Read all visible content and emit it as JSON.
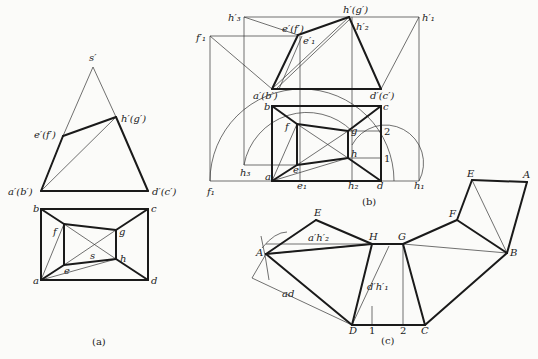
{
  "colors": {
    "line": "#1a1a1a",
    "thin": "#333333",
    "background": "#fbfbf9"
  },
  "figures": [
    {
      "id": "a",
      "caption": "(a)",
      "caption_pos": [
        92,
        345
      ],
      "thick_lines": [
        [
          [
            41,
            191
          ],
          [
            63,
            136
          ]
        ],
        [
          [
            63,
            136
          ],
          [
            116,
            117
          ]
        ],
        [
          [
            116,
            117
          ],
          [
            148,
            191
          ]
        ],
        [
          [
            41,
            191
          ],
          [
            148,
            191
          ]
        ],
        [
          [
            41,
            209
          ],
          [
            148,
            209
          ]
        ],
        [
          [
            148,
            209
          ],
          [
            148,
            280
          ]
        ],
        [
          [
            148,
            280
          ],
          [
            41,
            280
          ]
        ],
        [
          [
            41,
            280
          ],
          [
            41,
            209
          ]
        ],
        [
          [
            41,
            209
          ],
          [
            64,
            224
          ]
        ],
        [
          [
            64,
            224
          ],
          [
            116,
            230
          ]
        ],
        [
          [
            116,
            230
          ],
          [
            148,
            209
          ]
        ],
        [
          [
            64,
            224
          ],
          [
            64,
            265
          ]
        ],
        [
          [
            64,
            265
          ],
          [
            116,
            259
          ]
        ],
        [
          [
            116,
            259
          ],
          [
            116,
            230
          ]
        ],
        [
          [
            41,
            280
          ],
          [
            64,
            265
          ]
        ],
        [
          [
            116,
            259
          ],
          [
            148,
            280
          ]
        ]
      ],
      "thin_lines": [
        [
          [
            63,
            136
          ],
          [
            93,
            67
          ]
        ],
        [
          [
            93,
            67
          ],
          [
            116,
            117
          ]
        ],
        [
          [
            41,
            191
          ],
          [
            116,
            117
          ]
        ],
        [
          [
            64,
            224
          ],
          [
            116,
            259
          ]
        ],
        [
          [
            116,
            230
          ],
          [
            64,
            265
          ]
        ],
        [
          [
            41,
            280
          ],
          [
            64,
            224
          ]
        ],
        [
          [
            41,
            280
          ],
          [
            116,
            259
          ]
        ]
      ],
      "labels": [
        {
          "text": "s′",
          "x": 89,
          "y": 61
        },
        {
          "text": "h′(g′)",
          "x": 121,
          "y": 122
        },
        {
          "text": "e′(f′)",
          "x": 34,
          "y": 138
        },
        {
          "text": "a′(b′)",
          "x": 8,
          "y": 195
        },
        {
          "text": "d′(c′)",
          "x": 152,
          "y": 195
        },
        {
          "text": "b",
          "x": 33,
          "y": 212
        },
        {
          "text": "c",
          "x": 151,
          "y": 212
        },
        {
          "text": "f",
          "x": 53,
          "y": 235
        },
        {
          "text": "g",
          "x": 119,
          "y": 235
        },
        {
          "text": "s",
          "x": 90,
          "y": 259
        },
        {
          "text": "h",
          "x": 120,
          "y": 262
        },
        {
          "text": "e",
          "x": 64,
          "y": 274
        },
        {
          "text": "a",
          "x": 33,
          "y": 284
        },
        {
          "text": "d",
          "x": 151,
          "y": 284
        }
      ]
    },
    {
      "id": "b",
      "caption": "(b)",
      "caption_pos": [
        362,
        205
      ],
      "thick_lines": [
        [
          [
            272,
            89
          ],
          [
            298,
            35
          ]
        ],
        [
          [
            298,
            35
          ],
          [
            349,
            17
          ]
        ],
        [
          [
            349,
            17
          ],
          [
            381,
            89
          ]
        ],
        [
          [
            272,
            89
          ],
          [
            381,
            89
          ]
        ],
        [
          [
            272,
            106
          ],
          [
            381,
            106
          ]
        ],
        [
          [
            381,
            106
          ],
          [
            381,
            181
          ]
        ],
        [
          [
            381,
            181
          ],
          [
            272,
            181
          ]
        ],
        [
          [
            272,
            181
          ],
          [
            272,
            106
          ]
        ],
        [
          [
            272,
            106
          ],
          [
            297,
            124
          ]
        ],
        [
          [
            297,
            124
          ],
          [
            348,
            131
          ]
        ],
        [
          [
            348,
            131
          ],
          [
            381,
            106
          ]
        ],
        [
          [
            297,
            124
          ],
          [
            297,
            165
          ]
        ],
        [
          [
            297,
            165
          ],
          [
            348,
            158
          ]
        ],
        [
          [
            348,
            158
          ],
          [
            348,
            131
          ]
        ],
        [
          [
            272,
            181
          ],
          [
            297,
            165
          ]
        ],
        [
          [
            348,
            158
          ],
          [
            381,
            181
          ]
        ]
      ],
      "thin_lines": [
        [
          [
            244,
            17
          ],
          [
            419,
            17
          ]
        ],
        [
          [
            210,
            36
          ],
          [
            298,
            36
          ]
        ],
        [
          [
            244,
            17
          ],
          [
            244,
            165
          ]
        ],
        [
          [
            210,
            36
          ],
          [
            210,
            181
          ]
        ],
        [
          [
            419,
            17
          ],
          [
            419,
            181
          ]
        ],
        [
          [
            300,
            36
          ],
          [
            300,
            181
          ]
        ],
        [
          [
            352,
            17
          ],
          [
            352,
            181
          ]
        ],
        [
          [
            210,
            181
          ],
          [
            419,
            181
          ]
        ],
        [
          [
            244,
            165
          ],
          [
            297,
            165
          ]
        ],
        [
          [
            348,
            131
          ],
          [
            381,
            131
          ]
        ],
        [
          [
            348,
            158
          ],
          [
            381,
            158
          ]
        ],
        [
          [
            244,
            17
          ],
          [
            298,
            35
          ]
        ],
        [
          [
            210,
            36
          ],
          [
            272,
            89
          ]
        ],
        [
          [
            419,
            17
          ],
          [
            381,
            89
          ]
        ],
        [
          [
            272,
            89
          ],
          [
            349,
            17
          ]
        ],
        [
          [
            276,
            89
          ],
          [
            350,
            19
          ]
        ],
        [
          [
            279,
            89
          ],
          [
            302,
            36
          ]
        ],
        [
          [
            272,
            181
          ],
          [
            297,
            124
          ]
        ],
        [
          [
            297,
            124
          ],
          [
            348,
            158
          ]
        ],
        [
          [
            348,
            131
          ],
          [
            297,
            165
          ]
        ],
        [
          [
            272,
            181
          ],
          [
            348,
            158
          ]
        ]
      ],
      "arcs": [
        "M 210 181 A 92 92 0 0 1 394 181",
        "M 244 165 A 64 64 0 0 1 352 131",
        "M 352 145 A 36 36 0 0 1 419 181"
      ],
      "labels": [
        {
          "text": "h′₃",
          "x": 228,
          "y": 21
        },
        {
          "text": "h′(g′)",
          "x": 343,
          "y": 13
        },
        {
          "text": "h′₁",
          "x": 422,
          "y": 21
        },
        {
          "text": "f′₁",
          "x": 196,
          "y": 41
        },
        {
          "text": "e′(f′)",
          "x": 282,
          "y": 32
        },
        {
          "text": "e′₁",
          "x": 303,
          "y": 44
        },
        {
          "text": "h′₂",
          "x": 356,
          "y": 30
        },
        {
          "text": "a′(b′)",
          "x": 253,
          "y": 99
        },
        {
          "text": "d′(c′)",
          "x": 370,
          "y": 99
        },
        {
          "text": "b",
          "x": 264,
          "y": 110
        },
        {
          "text": "c",
          "x": 383,
          "y": 110
        },
        {
          "text": "f",
          "x": 285,
          "y": 130
        },
        {
          "text": "g",
          "x": 351,
          "y": 134
        },
        {
          "text": "h",
          "x": 351,
          "y": 157
        },
        {
          "text": "e",
          "x": 293,
          "y": 173
        },
        {
          "text": "h₃",
          "x": 240,
          "y": 176
        },
        {
          "text": "a",
          "x": 265,
          "y": 180
        },
        {
          "text": "e₁",
          "x": 297,
          "y": 189
        },
        {
          "text": "h₂",
          "x": 348,
          "y": 189
        },
        {
          "text": "d",
          "x": 377,
          "y": 189
        },
        {
          "text": "h₁",
          "x": 414,
          "y": 189
        },
        {
          "text": "f₁",
          "x": 207,
          "y": 195
        }
      ],
      "numbers": [
        {
          "text": "2",
          "x": 384,
          "y": 135
        },
        {
          "text": "1",
          "x": 384,
          "y": 162
        }
      ]
    },
    {
      "id": "c",
      "caption": "(c)",
      "caption_pos": [
        381,
        344
      ],
      "thick_lines": [
        [
          [
            266,
            254
          ],
          [
            316,
            220
          ]
        ],
        [
          [
            316,
            220
          ],
          [
            372,
            244
          ]
        ],
        [
          [
            372,
            244
          ],
          [
            266,
            254
          ]
        ],
        [
          [
            266,
            254
          ],
          [
            352,
            325
          ]
        ],
        [
          [
            352,
            325
          ],
          [
            372,
            244
          ]
        ],
        [
          [
            372,
            244
          ],
          [
            403,
            244
          ]
        ],
        [
          [
            403,
            244
          ],
          [
            425,
            325
          ]
        ],
        [
          [
            425,
            325
          ],
          [
            352,
            325
          ]
        ],
        [
          [
            403,
            244
          ],
          [
            457,
            220
          ]
        ],
        [
          [
            457,
            220
          ],
          [
            472,
            180
          ]
        ],
        [
          [
            472,
            180
          ],
          [
            527,
            182
          ]
        ],
        [
          [
            527,
            182
          ],
          [
            507,
            253
          ]
        ],
        [
          [
            507,
            253
          ],
          [
            457,
            220
          ]
        ],
        [
          [
            507,
            253
          ],
          [
            425,
            325
          ]
        ]
      ],
      "thin_lines": [
        [
          [
            266,
            254
          ],
          [
            372,
            244
          ]
        ],
        [
          [
            266,
            244
          ],
          [
            372,
            244
          ]
        ],
        [
          [
            266,
            254
          ],
          [
            252,
            278
          ]
        ],
        [
          [
            252,
            278
          ],
          [
            352,
            325
          ]
        ],
        [
          [
            352,
            325
          ],
          [
            389,
            246
          ]
        ],
        [
          [
            403,
            244
          ],
          [
            403,
            325
          ]
        ],
        [
          [
            372,
            325
          ],
          [
            372,
            306
          ]
        ],
        [
          [
            403,
            244
          ],
          [
            507,
            253
          ]
        ],
        [
          [
            472,
            180
          ],
          [
            507,
            253
          ]
        ]
      ],
      "arcs": [
        "M 261 236 Q 266 258 269 280",
        "M 262 248 Q 275 232 287 232"
      ],
      "labels": [
        {
          "text": "E",
          "x": 314,
          "y": 216
        },
        {
          "text": "H",
          "x": 369,
          "y": 240
        },
        {
          "text": "G",
          "x": 398,
          "y": 240
        },
        {
          "text": "F",
          "x": 449,
          "y": 217
        },
        {
          "text": "E",
          "x": 467,
          "y": 177
        },
        {
          "text": "A",
          "x": 523,
          "y": 178
        },
        {
          "text": "B",
          "x": 510,
          "y": 256
        },
        {
          "text": "A",
          "x": 256,
          "y": 256
        },
        {
          "text": "a′h′₂",
          "x": 308,
          "y": 241
        },
        {
          "text": "ad",
          "x": 282,
          "y": 297
        },
        {
          "text": "d′h′₁",
          "x": 367,
          "y": 290
        },
        {
          "text": "D",
          "x": 349,
          "y": 334
        },
        {
          "text": "C",
          "x": 421,
          "y": 334
        }
      ],
      "numbers": [
        {
          "text": "1",
          "x": 369,
          "y": 334
        },
        {
          "text": "2",
          "x": 400,
          "y": 334
        }
      ]
    }
  ]
}
